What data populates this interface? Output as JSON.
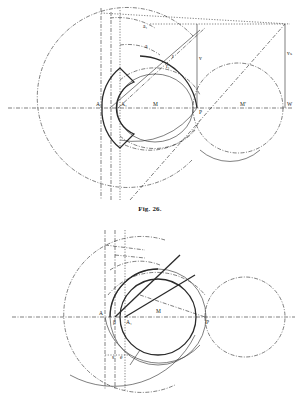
{
  "figures": [
    {
      "id": "fig-26",
      "caption": "Fig. 26.",
      "labels": {
        "A": "A",
        "A1": "A₁",
        "M": "M",
        "M_prime": "M'",
        "W": "W",
        "P": "P",
        "v": "v",
        "vs": "vₛ",
        "a": "a",
        "a1": "a₁",
        "r": "r",
        "r1": "r₁"
      }
    },
    {
      "id": "fig-27",
      "caption": "",
      "labels": {
        "A": "A",
        "A1": "A₁",
        "M": "M",
        "P": "P",
        "beta": "β",
        "s": "s",
        "e": "e"
      }
    }
  ],
  "top_text_fragment": "g g g g"
}
